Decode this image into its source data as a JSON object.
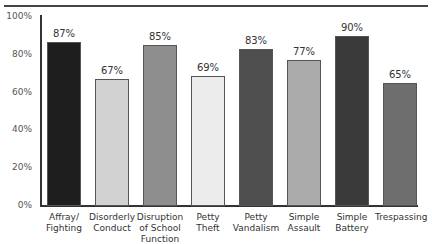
{
  "chart_data": {
    "type": "bar",
    "title": "",
    "xlabel": "",
    "ylabel": "",
    "ylim": [
      0,
      100
    ],
    "grid": false,
    "yticks": [
      "0%",
      "20%",
      "40%",
      "60%",
      "80%",
      "100%"
    ],
    "categories": [
      "Affray/ Fighting",
      "Disorderly Conduct",
      "Disruption of School Function",
      "Petty Theft",
      "Petty Vandalism",
      "Simple Assault",
      "Simple Battery",
      "Trespassing"
    ],
    "category_lines": [
      [
        "Affray/",
        "Fighting"
      ],
      [
        "Disorderly",
        "Conduct"
      ],
      [
        "Disruption",
        "of School",
        "Function"
      ],
      [
        "Petty",
        "Theft"
      ],
      [
        "Petty",
        "Vandalism"
      ],
      [
        "Simple",
        "Assault"
      ],
      [
        "Simple",
        "Battery"
      ],
      [
        "Trespassing"
      ]
    ],
    "values": [
      87,
      67,
      85,
      69,
      83,
      77,
      90,
      65
    ],
    "value_labels": [
      "87%",
      "67%",
      "85%",
      "69%",
      "83%",
      "77%",
      "90%",
      "65%"
    ],
    "colors": [
      "#1e1e1e",
      "#d2d2d2",
      "#8e8e8e",
      "#ececec",
      "#4e4e4e",
      "#ababab",
      "#3a3a3a",
      "#6e6e6e"
    ]
  }
}
